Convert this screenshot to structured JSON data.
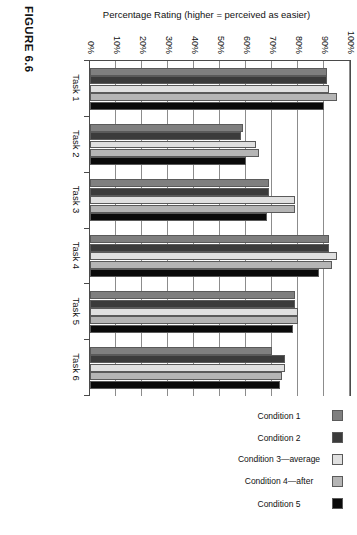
{
  "figure": {
    "caption": "FIGURE 6.6"
  },
  "chart_data": {
    "type": "bar",
    "orientation": "vertical-rendered-rotated",
    "title": "",
    "xlabel": "",
    "ylabel": "Percentage Rating (higher = perceived as easier)",
    "ylim": [
      0,
      100
    ],
    "ytick_labels": [
      "0%",
      "10%",
      "20%",
      "30%",
      "40%",
      "50%",
      "60%",
      "70%",
      "80%",
      "90%",
      "100%"
    ],
    "ytick_values": [
      0,
      10,
      20,
      30,
      40,
      50,
      60,
      70,
      80,
      90,
      100
    ],
    "grid": true,
    "grid_axis": "y",
    "legend_position": "right",
    "categories": [
      "Task 1",
      "Task 2",
      "Task 3",
      "Task 4",
      "Task 5",
      "Task 6"
    ],
    "series": [
      {
        "name": "Condition 1",
        "color": "#7f7f7f",
        "values": [
          91,
          59,
          69,
          92,
          79,
          70
        ]
      },
      {
        "name": "Condition 2",
        "color": "#3b3b3b",
        "values": [
          91,
          58,
          69,
          92,
          79,
          75
        ]
      },
      {
        "name": "Condition 3—average",
        "color": "#e0e0e0",
        "values": [
          92,
          64,
          79,
          95,
          80,
          75
        ]
      },
      {
        "name": "Condition 4—after",
        "color": "#b5b5b5",
        "values": [
          95,
          65,
          79,
          93,
          80,
          74
        ]
      },
      {
        "name": "Condition 5",
        "color": "#0a0a0a",
        "values": [
          90,
          60,
          68,
          88,
          78,
          73
        ]
      }
    ]
  }
}
